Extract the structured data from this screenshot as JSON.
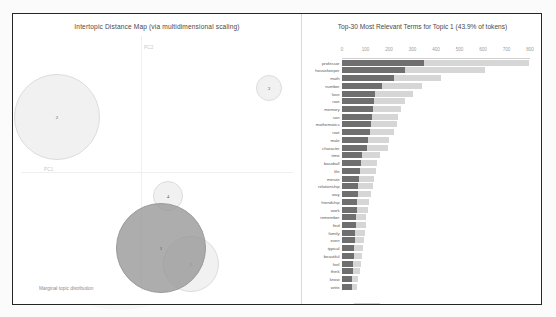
{
  "visualization": {
    "type": "pyLDAvis topic model",
    "left_panel": {
      "title": "Intertopic Distance Map (via multidimensional scaling)",
      "axis_x_label": "PC1",
      "axis_y_label": "PC2",
      "marginal_label": "Marginal topic distribution",
      "size_legend_label": "2%",
      "topics": [
        {
          "id": "1",
          "label": "1",
          "selected": true,
          "cx": 148,
          "cy": 234,
          "r": 45
        },
        {
          "id": "2",
          "label": "2",
          "selected": false,
          "cx": 44,
          "cy": 103,
          "r": 43
        },
        {
          "id": "3",
          "label": "3",
          "selected": false,
          "cx": 256,
          "cy": 74,
          "r": 13
        },
        {
          "id": "4",
          "label": "4",
          "selected": false,
          "cx": 155,
          "cy": 182,
          "r": 15
        },
        {
          "id": "5",
          "label": "5",
          "selected": false,
          "cx": 178,
          "cy": 250,
          "r": 28
        }
      ]
    },
    "right_panel": {
      "title": "Top-30 Most Relevant Terms for Topic 1 (43.9% of tokens)",
      "xticks": [
        0,
        100,
        200,
        300,
        400,
        500,
        600,
        700,
        800
      ],
      "xmax": 800,
      "legend": [
        {
          "key": "overall",
          "label": "Overall term frequency",
          "color": "#d6d6d6"
        },
        {
          "key": "topic",
          "label": "Estimated term frequency within the selected topic",
          "color": "#6f6f6f"
        }
      ]
    }
  },
  "chart_data": {
    "type": "bar",
    "title": "Top-30 Most Relevant Terms for Topic 1 (43.9% of tokens)",
    "xlabel": "",
    "ylabel": "",
    "xlim": [
      0,
      800
    ],
    "grid": false,
    "legend_position": "bottom",
    "orientation": "horizontal",
    "categories": [
      "professor",
      "housekeeper",
      "math",
      "number",
      "love",
      "root",
      "memory",
      "son",
      "mathematics",
      "root",
      "male",
      "character",
      "time",
      "baseball",
      "life",
      "minute",
      "relationship",
      "way",
      "friendship",
      "work",
      "remember",
      "find",
      "family",
      "even",
      "typical",
      "beautiful",
      "feel",
      "think",
      "know",
      "write"
    ],
    "series": [
      {
        "name": "Overall term frequency",
        "color": "#d6d6d6",
        "values": [
          795,
          610,
          420,
          340,
          300,
          270,
          252,
          240,
          232,
          222,
          200,
          196,
          160,
          150,
          146,
          138,
          130,
          122,
          116,
          110,
          104,
          100,
          96,
          92,
          88,
          84,
          80,
          76,
          70,
          64
        ]
      },
      {
        "name": "Estimated term frequency within the selected topic",
        "color": "#6f6f6f",
        "values": [
          350,
          270,
          222,
          172,
          142,
          136,
          130,
          126,
          122,
          118,
          112,
          106,
          86,
          82,
          78,
          74,
          70,
          68,
          64,
          62,
          60,
          58,
          56,
          54,
          52,
          50,
          48,
          46,
          44,
          42
        ]
      }
    ]
  }
}
